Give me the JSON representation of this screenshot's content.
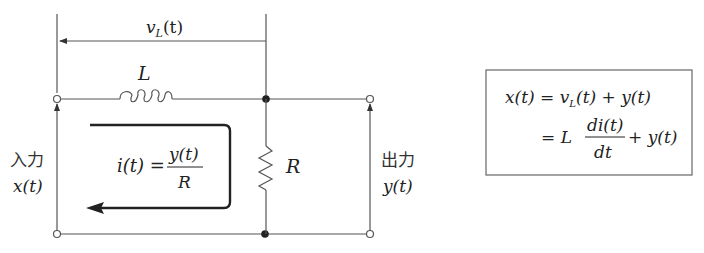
{
  "circuit": {
    "components": {
      "inductor_label": "L",
      "resistor_label": "R",
      "voltage_label": {
        "base": "v",
        "sub": "L",
        "arg": "(t)"
      }
    },
    "input": {
      "label_jp": "入力",
      "signal": "x(t)"
    },
    "output": {
      "label_jp": "出力",
      "signal": "y(t)"
    },
    "current": {
      "lhs": "i(t) =",
      "numerator": "y(t)",
      "denominator": "R"
    }
  },
  "equation_box": {
    "line1": {
      "lhs": "x(t) = ",
      "v": "v",
      "v_sub": "L",
      "rest": "(t) + y(t)"
    },
    "line2": {
      "eq": "= L",
      "numerator": "di(t)",
      "denominator": "dt",
      "rest": "+ y(t)"
    }
  },
  "colors": {
    "wire": "#555555",
    "text": "#222222",
    "background": "#ffffff"
  }
}
